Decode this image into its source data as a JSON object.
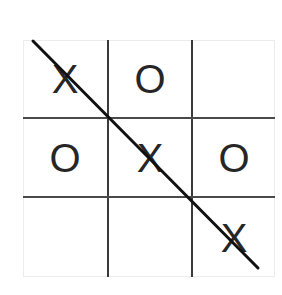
{
  "game": {
    "name": "Tic-Tac-Toe",
    "board": [
      [
        "X",
        "O",
        ""
      ],
      [
        "O",
        "X",
        "O"
      ],
      [
        "",
        "",
        "X"
      ]
    ],
    "winning_line": "diagonal",
    "winner": "X"
  },
  "colors": {
    "grid": "#3a3a3a",
    "marks": "#262626",
    "strike": "#111111",
    "background": "#ffffff"
  }
}
